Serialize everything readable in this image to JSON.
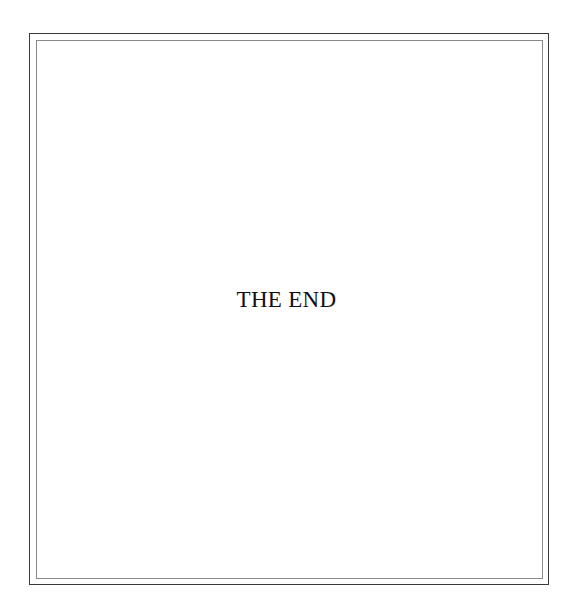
{
  "page": {
    "text": "THE END"
  }
}
